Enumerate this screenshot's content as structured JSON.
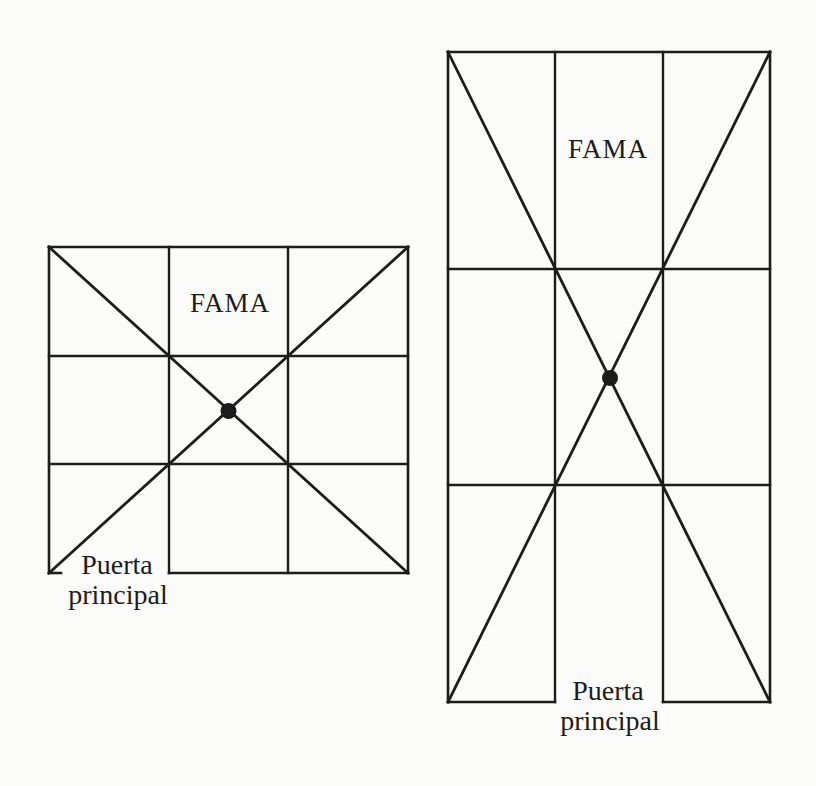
{
  "colors": {
    "ink": "#1c1c1c",
    "paper": "#fbfbf9"
  },
  "figures": {
    "small": {
      "sector_label": "FAMA",
      "door_label_line1": "Puerta",
      "door_label_line2": "principal",
      "center_marker": "filled-dot"
    },
    "large": {
      "sector_label": "FAMA",
      "door_label_line1": "Puerta",
      "door_label_line2": "principal",
      "center_marker": "filled-dot"
    }
  }
}
